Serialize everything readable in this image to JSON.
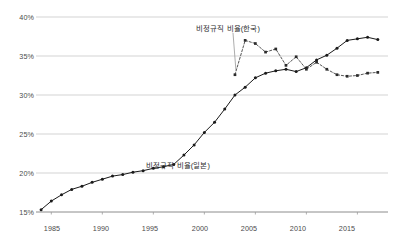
{
  "chart_data": {
    "type": "line",
    "title": "",
    "subtitle": "",
    "xlabel": "",
    "ylabel": "",
    "xlim": [
      1983.5,
      2018.0
    ],
    "ylim": [
      15,
      40
    ],
    "grid": true,
    "grid_axis": "y",
    "legend_position": "inline-annotation",
    "y_ticks": [
      "15%",
      "20%",
      "25%",
      "30%",
      "35%",
      "40%"
    ],
    "y_tick_values": [
      15,
      20,
      25,
      30,
      35,
      40
    ],
    "x_ticks": [
      "1985",
      "1990",
      "1995",
      "2000",
      "2005",
      "2010",
      "2015"
    ],
    "x_tick_values": [
      1985,
      1990,
      1995,
      2000,
      2005,
      2010,
      2015
    ],
    "series": [
      {
        "name": "비정규직 비율(일본)",
        "marker": "filled-circle",
        "linestyle": "solid",
        "color": "#1a1a1a",
        "x": [
          1984,
          1985,
          1986,
          1987,
          1988,
          1989,
          1990,
          1991,
          1992,
          1993,
          1994,
          1995,
          1996,
          1997,
          1998,
          1999,
          2000,
          2001,
          2002,
          2003,
          2004,
          2005,
          2006,
          2007,
          2008,
          2009,
          2010,
          2011,
          2012,
          2013,
          2014,
          2015,
          2016,
          2017
        ],
        "values": [
          15.3,
          16.4,
          17.2,
          17.9,
          18.3,
          18.8,
          19.2,
          19.6,
          19.8,
          20.1,
          20.3,
          20.6,
          20.8,
          21.1,
          22.3,
          23.6,
          25.2,
          26.5,
          28.2,
          30.0,
          31.0,
          32.2,
          32.8,
          33.1,
          33.3,
          33.0,
          33.5,
          34.5,
          35.1,
          36.0,
          37.0,
          37.2,
          37.4,
          37.1
        ]
      },
      {
        "name": "비정규직 비율(한국)",
        "marker": "filled-square",
        "linestyle": "dashed",
        "color": "#2b2b2b",
        "x": [
          2003,
          2004,
          2005,
          2006,
          2007,
          2008,
          2009,
          2010,
          2011,
          2012,
          2013,
          2014,
          2015,
          2016,
          2017
        ],
        "values": [
          32.6,
          37.0,
          36.6,
          35.5,
          35.9,
          33.8,
          34.9,
          33.3,
          34.2,
          33.3,
          32.6,
          32.4,
          32.5,
          32.8,
          32.9
        ]
      }
    ],
    "annotations": [
      {
        "text": "비정규직 비율(한국)",
        "target_x": 2003,
        "target_y": 32.6,
        "leader": true
      },
      {
        "text": "비정규직 비율(일본)",
        "target_x": 1996,
        "target_y": 20.8,
        "leader": false
      }
    ]
  },
  "axes": {
    "y_labels": [
      "40%",
      "35%",
      "30%",
      "25%",
      "20%",
      "15%"
    ],
    "x_labels": [
      "1985",
      "1990",
      "1995",
      "2000",
      "2005",
      "2010",
      "2015"
    ]
  },
  "annotations": {
    "korea_label": "비정규직 비율(한국)",
    "japan_label": "비정규직 비율(일본)"
  },
  "colors": {
    "grid": "#c8c8c8",
    "axis": "#9a9a9a",
    "series_japan": "#1a1a1a",
    "series_korea": "#2b2b2b",
    "text": "#4a4a4a",
    "background": "#ffffff"
  }
}
